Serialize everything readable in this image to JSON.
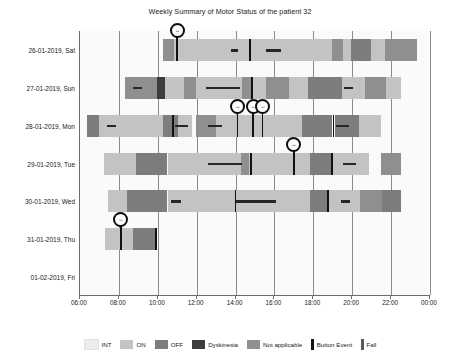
{
  "chart_data": {
    "type": "bar",
    "title": "Weekly Summary of Motor Status of the patient 32",
    "xlabel": "",
    "ylabel": "",
    "grid": true,
    "legend_position": "bottom",
    "x_axis": {
      "ticks": [
        "06:00",
        "08:00",
        "10:00",
        "12:00",
        "14:00",
        "16:00",
        "18:00",
        "20:00",
        "22:00",
        "00:00"
      ],
      "min_hour": 6,
      "max_hour": 24
    },
    "categories": [
      "26-01-2019, Sat",
      "27-01-2019, Sun",
      "28-01-2019, Mon",
      "29-01-2019, Tue",
      "30-01-2019, Wed",
      "31-01-2019, Thu",
      "01-02-2019, Fri"
    ],
    "status_colors": {
      "INT": "#ececec",
      "ON": "#c3c3c3",
      "OFF": "#7d7d7d",
      "Dyskinesia": "#3d3d3d",
      "Not applicable": "#8f8f8f",
      "Button Event": "#111111",
      "Fall": "#262626"
    },
    "series": [
      {
        "name": "26-01-2019, Sat",
        "segments": [
          {
            "status": "Not applicable",
            "start": 10.25,
            "end": 10.85
          },
          {
            "status": "ON",
            "start": 10.85,
            "end": 18.95
          },
          {
            "status": "Not applicable",
            "start": 18.95,
            "end": 19.55
          },
          {
            "status": "ON",
            "start": 19.55,
            "end": 19.95
          },
          {
            "status": "OFF",
            "start": 19.95,
            "end": 20.95
          },
          {
            "status": "ON",
            "start": 20.95,
            "end": 21.7
          },
          {
            "status": "Not applicable",
            "start": 21.7,
            "end": 23.35
          }
        ],
        "button_events": [
          10.8
        ],
        "markers": [
          10.95
        ],
        "falls": [
          {
            "start": 13.75,
            "end": 14.15
          },
          {
            "start": 15.55,
            "end": 16.35
          }
        ],
        "event_lines": [
          14.7
        ]
      },
      {
        "name": "27-01-2019, Sun",
        "segments": [
          {
            "status": "Not applicable",
            "start": 8.3,
            "end": 9.95
          },
          {
            "status": "Dyskinesia",
            "start": 9.95,
            "end": 10.35
          },
          {
            "status": "ON",
            "start": 10.35,
            "end": 11.35
          },
          {
            "status": "Not applicable",
            "start": 11.35,
            "end": 11.95
          },
          {
            "status": "ON",
            "start": 11.95,
            "end": 14.35
          },
          {
            "status": "Not applicable",
            "start": 14.35,
            "end": 14.85
          },
          {
            "status": "ON",
            "start": 14.85,
            "end": 15.55
          },
          {
            "status": "Not applicable",
            "start": 15.55,
            "end": 16.75
          },
          {
            "status": "ON",
            "start": 16.75,
            "end": 17.75
          },
          {
            "status": "OFF",
            "start": 17.75,
            "end": 19.45
          },
          {
            "status": "ON",
            "start": 19.45,
            "end": 20.65
          },
          {
            "status": "Not applicable",
            "start": 20.65,
            "end": 21.75
          },
          {
            "status": "ON",
            "start": 21.75,
            "end": 22.5
          }
        ],
        "button_events": [
          19.2
        ],
        "markers": [],
        "falls": [
          {
            "start": 8.75,
            "end": 9.2
          },
          {
            "start": 12.5,
            "end": 14.25
          },
          {
            "start": 19.6,
            "end": 20.05
          }
        ],
        "event_lines": [
          14.8
        ]
      },
      {
        "name": "28-01-2019, Mon",
        "segments": [
          {
            "status": "OFF",
            "start": 6.35,
            "end": 7.0
          },
          {
            "status": "ON",
            "start": 7.0,
            "end": 10.25
          },
          {
            "status": "OFF",
            "start": 10.25,
            "end": 11.05
          },
          {
            "status": "ON",
            "start": 11.05,
            "end": 11.75
          },
          {
            "status": "Not applicable",
            "start": 11.95,
            "end": 13.0
          },
          {
            "status": "ON",
            "start": 13.0,
            "end": 17.4
          },
          {
            "status": "OFF",
            "start": 17.4,
            "end": 18.95
          },
          {
            "status": "OFF",
            "start": 19.1,
            "end": 20.35
          },
          {
            "status": "ON",
            "start": 20.35,
            "end": 21.5
          }
        ],
        "button_events": [
          14.05,
          14.9,
          15.35
        ],
        "markers": [
          14.05,
          14.85,
          15.35
        ],
        "falls": [
          {
            "start": 7.4,
            "end": 7.85
          },
          {
            "start": 12.6,
            "end": 13.3
          },
          {
            "start": 10.9,
            "end": 11.55
          },
          {
            "start": 19.15,
            "end": 19.85
          }
        ],
        "event_lines": [
          10.75,
          19.0
        ]
      },
      {
        "name": "29-01-2019, Tue",
        "segments": [
          {
            "status": "ON",
            "start": 7.25,
            "end": 8.9
          },
          {
            "status": "OFF",
            "start": 8.9,
            "end": 10.5
          },
          {
            "status": "ON",
            "start": 10.5,
            "end": 14.3
          },
          {
            "status": "Not applicable",
            "start": 14.3,
            "end": 14.7
          },
          {
            "status": "ON",
            "start": 14.7,
            "end": 17.85
          },
          {
            "status": "OFF",
            "start": 17.85,
            "end": 18.95
          },
          {
            "status": "ON",
            "start": 18.95,
            "end": 20.85
          },
          {
            "status": "Not applicable",
            "start": 21.5,
            "end": 22.5
          }
        ],
        "button_events": [
          14.75,
          18.9
        ],
        "markers": [
          16.95
        ],
        "falls": [
          {
            "start": 12.6,
            "end": 14.35
          },
          {
            "start": 19.5,
            "end": 20.2
          }
        ],
        "event_lines": [
          14.75,
          18.9
        ]
      },
      {
        "name": "30-01-2019, Wed",
        "segments": [
          {
            "status": "ON",
            "start": 7.45,
            "end": 8.4
          },
          {
            "status": "OFF",
            "start": 8.4,
            "end": 10.45
          },
          {
            "status": "ON",
            "start": 10.55,
            "end": 17.85
          },
          {
            "status": "OFF",
            "start": 17.85,
            "end": 18.75
          },
          {
            "status": "ON",
            "start": 18.75,
            "end": 20.4
          },
          {
            "status": "Not applicable",
            "start": 20.4,
            "end": 21.55
          },
          {
            "status": "OFF",
            "start": 21.55,
            "end": 22.5
          }
        ],
        "button_events": [
          18.7
        ],
        "markers": [],
        "falls": [
          {
            "start": 10.7,
            "end": 11.2
          },
          {
            "start": 13.95,
            "end": 16.1
          },
          {
            "start": 19.4,
            "end": 19.9
          }
        ],
        "event_lines": [
          13.95,
          18.7
        ]
      },
      {
        "name": "31-01-2019, Thu",
        "segments": [
          {
            "status": "ON",
            "start": 7.3,
            "end": 8.75
          },
          {
            "status": "OFF",
            "start": 8.75,
            "end": 9.9
          }
        ],
        "button_events": [
          9.85
        ],
        "markers": [
          8.05
        ],
        "falls": [],
        "event_lines": [
          9.85
        ]
      },
      {
        "name": "01-02-2019, Fri",
        "segments": [],
        "button_events": [],
        "markers": [],
        "falls": [],
        "event_lines": []
      }
    ],
    "legend": [
      {
        "label": "INT",
        "color": "#ececec",
        "shape": "box"
      },
      {
        "label": "ON",
        "color": "#c3c3c3",
        "shape": "box"
      },
      {
        "label": "OFF",
        "color": "#7d7d7d",
        "shape": "box"
      },
      {
        "label": "Dyskinesia",
        "color": "#3d3d3d",
        "shape": "box"
      },
      {
        "label": "Not applicable",
        "color": "#8f8f8f",
        "shape": "box"
      },
      {
        "label": "Button Event",
        "color": "#111111",
        "shape": "bar"
      },
      {
        "label": "Fall",
        "color": "#5a5a5a",
        "shape": "bar"
      }
    ],
    "marker_glyph": "↔"
  }
}
